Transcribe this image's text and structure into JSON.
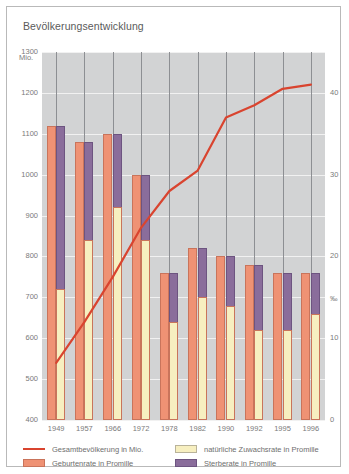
{
  "panel": {
    "title": "Bevölkerungsentwicklung"
  },
  "axes": {
    "left_unit": "Mio.",
    "right_unit": "‰",
    "left_ticks": [
      "1300",
      "1200",
      "1100",
      "1000",
      "900",
      "800",
      "700",
      "600",
      "500",
      "400"
    ],
    "right_ticks": [
      "40",
      "30",
      "20",
      "10",
      "0"
    ]
  },
  "legend": [
    {
      "key": "line",
      "label": "Gesamtbevölkerung in Mio.",
      "color": "#d9442f"
    },
    {
      "key": "nat",
      "label": "natürliche Zuwachsrate in Promille",
      "color": "#f7efc0"
    },
    {
      "key": "birth",
      "label": "Geburtenrate in Promille",
      "color": "#ef9274"
    },
    {
      "key": "death",
      "label": "Sterberate in Promille",
      "color": "#8a6d9b"
    }
  ],
  "chart_data": {
    "type": "bar",
    "title": "Bevölkerungsentwicklung",
    "xlabel": "",
    "ylabel": "Mio.",
    "y2label": "‰",
    "ylim": [
      400,
      1300
    ],
    "y2lim": [
      0,
      45
    ],
    "grid": true,
    "legend_position": "bottom",
    "categories": [
      "1949",
      "1957",
      "1966",
      "1972",
      "1978",
      "1982",
      "1990",
      "1992",
      "1995",
      "1996"
    ],
    "series": [
      {
        "name": "Gesamtbevölkerung in Mio.",
        "type": "line",
        "axis": "left",
        "values": [
          540,
          640,
          750,
          870,
          960,
          1010,
          1140,
          1170,
          1210,
          1220
        ]
      },
      {
        "name": "Geburtenrate in Promille",
        "type": "bar",
        "axis": "right",
        "values": [
          36,
          34,
          35,
          30,
          18,
          21,
          20,
          19,
          18,
          18
        ]
      },
      {
        "name": "Sterberate in Promille",
        "type": "bar",
        "axis": "right",
        "values": [
          20,
          12,
          9,
          8,
          6,
          6,
          6,
          8,
          7,
          5
        ]
      },
      {
        "name": "natürliche Zuwachsrate in Promille",
        "type": "bar",
        "axis": "right",
        "values": [
          16,
          22,
          26,
          22,
          12,
          15,
          14,
          11,
          11,
          13
        ]
      }
    ]
  }
}
